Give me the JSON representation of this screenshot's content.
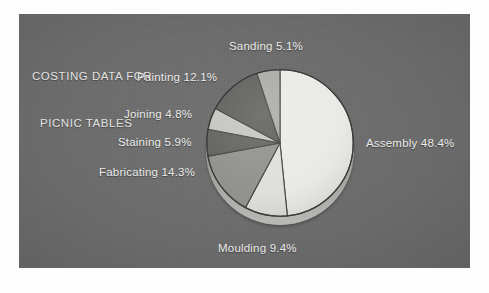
{
  "panel": {
    "background_color": "#6c6c6c",
    "page_background_color": "#fdfdfd"
  },
  "title": {
    "line1": "COSTING DATA FOR",
    "line2": "PICNIC TABLES",
    "color": "#e3e3e0"
  },
  "labels": {
    "sanding": "Sanding 5.1%",
    "painting": "Painting 12.1%",
    "joining": "Joining 4.8%",
    "staining": "Staining 5.9%",
    "fabricating": "Fabricating 14.3%",
    "moulding": "Moulding 9.4%",
    "assembly": "Assembly 48.4%"
  },
  "chart_data": {
    "type": "pie",
    "title": "COSTING DATA FOR PICNIC TABLES",
    "xlabel": "",
    "ylabel": "",
    "units": "percent",
    "total": 100.0,
    "start_angle_deg": 0,
    "direction": "clockwise",
    "legend": "none-labels-outside",
    "grid": false,
    "categories": [
      "Assembly",
      "Moulding",
      "Fabricating",
      "Staining",
      "Joining",
      "Painting",
      "Sanding"
    ],
    "values": [
      48.4,
      9.4,
      14.3,
      5.9,
      4.8,
      12.1,
      5.1
    ],
    "slices": [
      {
        "name": "Assembly",
        "value": 48.4,
        "label": "Assembly 48.4%",
        "color": "#e9e9e6",
        "angle_deg": 174.2
      },
      {
        "name": "Moulding",
        "value": 9.4,
        "label": "Moulding 9.4%",
        "color": "#dedeDA",
        "angle_deg": 33.8
      },
      {
        "name": "Fabricating",
        "value": 14.3,
        "label": "Fabricating 14.3%",
        "color": "#8f8f8c",
        "angle_deg": 51.5
      },
      {
        "name": "Staining",
        "value": 5.9,
        "label": "Staining 5.9%",
        "color": "#5f5f5d",
        "angle_deg": 21.2
      },
      {
        "name": "Joining",
        "value": 4.8,
        "label": "Joining 4.8%",
        "color": "#c3c3bf",
        "angle_deg": 17.3
      },
      {
        "name": "Painting",
        "value": 12.1,
        "label": "Painting 12.1%",
        "color": "#5a5a58",
        "angle_deg": 43.6
      },
      {
        "name": "Sanding",
        "value": 5.1,
        "label": "Sanding 5.1%",
        "color": "#a8a8a4",
        "angle_deg": 18.4
      }
    ]
  }
}
